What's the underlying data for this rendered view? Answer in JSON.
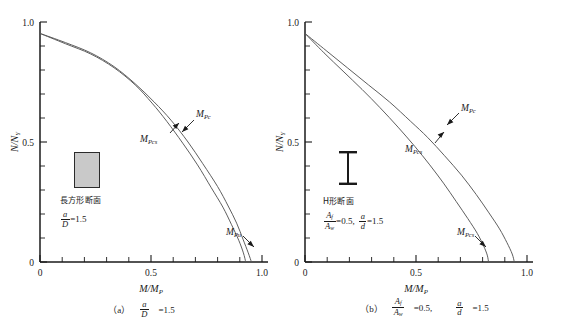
{
  "figure": {
    "background": "#ffffff",
    "line_color": "#555555",
    "axis_color": "#1a1a1a"
  },
  "panels": [
    {
      "id": "a",
      "axes": {
        "xlabel": "M/M",
        "xlabel_sub": "P",
        "ylabel": "N/N",
        "ylabel_sub": "Y",
        "xticks": [
          "0",
          "0.5",
          "1.0"
        ],
        "yticks": [
          "0",
          "0.5",
          "1.0"
        ],
        "xlim": [
          0,
          1.05
        ],
        "ylim": [
          0,
          1.05
        ],
        "xminor_count": 10,
        "yminor_count": 10
      },
      "legend": {
        "section_label": "長方形断面",
        "section_shape": "rectangle",
        "equations": [
          {
            "num": "a",
            "den": "D",
            "value": "=1.5"
          }
        ]
      },
      "curve_labels": [
        {
          "name": "M",
          "sub": "Pc",
          "x": 196,
          "y": 116
        },
        {
          "name": "M",
          "sub": "Pcs",
          "x": 164,
          "y": 136
        },
        {
          "name": "M",
          "sub": "Pu",
          "x": 234,
          "y": 231
        }
      ],
      "caption": {
        "tag": "（a）",
        "equations": [
          {
            "num": "a",
            "den": "D",
            "value": "=1.5"
          }
        ]
      }
    },
    {
      "id": "b",
      "axes": {
        "xlabel": "M/M",
        "xlabel_sub": "P",
        "ylabel": "N/N",
        "ylabel_sub": "Y",
        "xticks": [
          "0",
          "0.5",
          "1.0"
        ],
        "yticks": [
          "0",
          "0.5",
          "1.0"
        ],
        "xlim": [
          0,
          1.05
        ],
        "ylim": [
          0,
          1.05
        ],
        "xminor_count": 10,
        "yminor_count": 10
      },
      "legend": {
        "section_label": "H形断面",
        "section_shape": "i-beam",
        "equations": [
          {
            "num": "A",
            "num_sub": "f",
            "den": "A",
            "den_sub": "w",
            "value": "=0.5,"
          },
          {
            "num": "a",
            "den": "d",
            "value": "=1.5"
          }
        ]
      },
      "curve_labels": [
        {
          "name": "M",
          "sub": "Pc",
          "x": 178,
          "y": 110
        },
        {
          "name": "M",
          "sub": "Pcs",
          "x": 150,
          "y": 146
        },
        {
          "name": "M",
          "sub": "Pcs2",
          "x": 185,
          "y": 231
        }
      ],
      "caption": {
        "tag": "（b）",
        "equations": [
          {
            "num": "A",
            "num_sub": "f",
            "den": "A",
            "den_sub": "w",
            "value": "=0.5,"
          },
          {
            "num": "a",
            "den": "d",
            "value": "=1.5"
          }
        ]
      }
    }
  ],
  "chart_data": {
    "type": "line",
    "title": "",
    "xlabel": "M/M_P",
    "ylabel": "N/N_Y",
    "xlim": [
      0,
      1.05
    ],
    "ylim": [
      0,
      1.05
    ],
    "xticks": [
      0,
      0.5,
      1.0
    ],
    "yticks": [
      0,
      0.5,
      1.0
    ],
    "grid": false,
    "legend_position": "inline-annotations",
    "panels": [
      {
        "panel": "(a) a/D = 1.5",
        "section": "rectangular",
        "series": [
          {
            "name": "M_Pc",
            "points": [
              [
                0.0,
                1.0
              ],
              [
                0.12,
                0.96
              ],
              [
                0.24,
                0.915
              ],
              [
                0.35,
                0.855
              ],
              [
                0.45,
                0.78
              ],
              [
                0.54,
                0.7
              ],
              [
                0.62,
                0.62
              ],
              [
                0.7,
                0.525
              ],
              [
                0.77,
                0.43
              ],
              [
                0.84,
                0.33
              ],
              [
                0.89,
                0.245
              ],
              [
                0.93,
                0.17
              ],
              [
                0.96,
                0.1
              ],
              [
                0.985,
                0.04
              ],
              [
                1.0,
                0.0
              ]
            ]
          },
          {
            "name": "M_Pcs",
            "points": [
              [
                0.0,
                1.0
              ],
              [
                0.12,
                0.955
              ],
              [
                0.24,
                0.91
              ],
              [
                0.35,
                0.85
              ],
              [
                0.45,
                0.775
              ],
              [
                0.53,
                0.695
              ],
              [
                0.6,
                0.615
              ],
              [
                0.675,
                0.52
              ],
              [
                0.745,
                0.425
              ],
              [
                0.81,
                0.325
              ],
              [
                0.865,
                0.24
              ],
              [
                0.905,
                0.165
              ],
              [
                0.94,
                0.095
              ],
              [
                0.962,
                0.04
              ],
              [
                0.973,
                0.0
              ]
            ]
          }
        ]
      },
      {
        "panel": "(b) A_f/A_w = 0.5, a/d = 1.5",
        "section": "H-shape",
        "series": [
          {
            "name": "M_Pc",
            "points": [
              [
                0.0,
                1.0
              ],
              [
                0.1,
                0.925
              ],
              [
                0.2,
                0.85
              ],
              [
                0.3,
                0.775
              ],
              [
                0.4,
                0.7
              ],
              [
                0.5,
                0.615
              ],
              [
                0.58,
                0.545
              ],
              [
                0.66,
                0.465
              ],
              [
                0.74,
                0.38
              ],
              [
                0.81,
                0.295
              ],
              [
                0.87,
                0.215
              ],
              [
                0.92,
                0.145
              ],
              [
                0.955,
                0.085
              ],
              [
                0.98,
                0.035
              ],
              [
                0.99,
                0.0
              ]
            ]
          },
          {
            "name": "M_Pcs",
            "points": [
              [
                0.0,
                1.0
              ],
              [
                0.09,
                0.915
              ],
              [
                0.18,
                0.835
              ],
              [
                0.27,
                0.755
              ],
              [
                0.355,
                0.675
              ],
              [
                0.44,
                0.59
              ],
              [
                0.52,
                0.505
              ],
              [
                0.59,
                0.425
              ],
              [
                0.655,
                0.345
              ],
              [
                0.715,
                0.265
              ],
              [
                0.77,
                0.19
              ],
              [
                0.815,
                0.125
              ],
              [
                0.845,
                0.07
              ],
              [
                0.862,
                0.03
              ],
              [
                0.868,
                0.0
              ]
            ]
          }
        ]
      }
    ]
  }
}
